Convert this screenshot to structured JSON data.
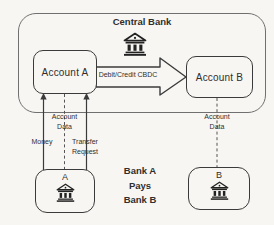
{
  "colors": {
    "background": "#f8f6f3",
    "line": "#3b3b3b",
    "container_border": "#707070",
    "text": "#2f2f2f"
  },
  "central_bank": {
    "title": "Central Bank",
    "icon": "bank-icon"
  },
  "accounts": {
    "a": "Account A",
    "b": "Account B"
  },
  "transfer_arrow": {
    "label": "Debit/Credit CBDC",
    "direction": "account-a-to-account-b"
  },
  "links": {
    "money": "Money",
    "account_data_left": "Account\nData",
    "transfer_request": "Transfer\nRequest",
    "account_data_right": "Account\nData"
  },
  "banks": {
    "a": "A",
    "b": "B",
    "icon": "bank-icon",
    "caption": "Bank A\nPays\nBank B"
  }
}
